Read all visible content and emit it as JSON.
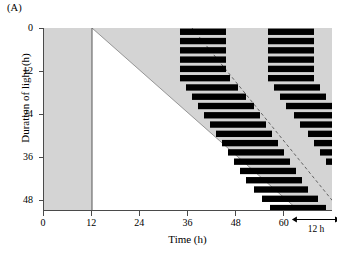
{
  "figure": {
    "panel_label": "(A)",
    "background_color": "#ffffff",
    "dark_shade_color": "#d4d4d4",
    "light_color": "#ffffff",
    "bar_color": "#000000",
    "axis_color": "#4a4a4a",
    "onset_line_color": "#8c8c8c"
  },
  "axes": {
    "x": {
      "label": "Time (h)",
      "ticks": [
        0,
        12,
        24,
        36,
        48,
        60
      ],
      "tick_labels": [
        "0",
        "12",
        "24",
        "36",
        "48",
        "60"
      ],
      "min": 0,
      "max": 72
    },
    "y": {
      "label": "Duration of light (h)",
      "ticks": [
        0,
        12,
        24,
        36,
        48
      ],
      "tick_labels": [
        "0",
        "12",
        "24",
        "36",
        "48"
      ],
      "min": 0,
      "max": 51
    }
  },
  "annotation": {
    "label": "12 h",
    "span_start_h": 62,
    "span_end_h": 74,
    "arrow_y_h": 51.5
  },
  "chart_data": {
    "type": "actogram",
    "title": "",
    "xlabel": "Time (h)",
    "ylabel": "Duration of light (h)",
    "xlim": [
      0,
      72
    ],
    "ylim": [
      0,
      51
    ],
    "grid": false,
    "legend": "none",
    "regions": {
      "dark_shaded": "grey region outside the light triangle",
      "light_triangle": {
        "vertices_h": [
          [
            12,
            0
          ],
          [
            12,
            51
          ],
          [
            63.5,
            51
          ]
        ],
        "note": "Light onset fixed at 12 h; light offset increases linearly with duration of light"
      },
      "light_offset_line": {
        "from": [
          12,
          0
        ],
        "to": [
          63.5,
          51
        ]
      }
    },
    "dashed_onset_line": {
      "label": "predicted activity onset",
      "from_h": [
        37.0,
        0
      ],
      "to_h": [
        74.0,
        51
      ],
      "style": "dashed"
    },
    "bars": [
      {
        "row": 0,
        "y_h": 0.0,
        "segments": [
          [
            34.0,
            45.5
          ],
          [
            56.0,
            67.5
          ]
        ]
      },
      {
        "row": 1,
        "y_h": 2.6,
        "segments": [
          [
            34.0,
            45.5
          ],
          [
            56.0,
            67.5
          ]
        ]
      },
      {
        "row": 2,
        "y_h": 5.2,
        "segments": [
          [
            34.0,
            45.5
          ],
          [
            56.0,
            67.5
          ]
        ]
      },
      {
        "row": 3,
        "y_h": 7.8,
        "segments": [
          [
            34.0,
            45.5
          ],
          [
            56.0,
            67.5
          ]
        ]
      },
      {
        "row": 4,
        "y_h": 10.4,
        "segments": [
          [
            34.0,
            45.5
          ],
          [
            56.0,
            67.5
          ]
        ]
      },
      {
        "row": 5,
        "y_h": 13.0,
        "segments": [
          [
            34.0,
            46.5
          ],
          [
            56.0,
            67.5
          ]
        ]
      },
      {
        "row": 6,
        "y_h": 15.6,
        "segments": [
          [
            35.5,
            48.5
          ],
          [
            57.5,
            69.0
          ]
        ]
      },
      {
        "row": 7,
        "y_h": 18.2,
        "segments": [
          [
            37.0,
            50.5
          ],
          [
            59.0,
            70.5
          ]
        ]
      },
      {
        "row": 8,
        "y_h": 20.8,
        "segments": [
          [
            38.5,
            52.5
          ],
          [
            60.5,
            72.0
          ]
        ]
      },
      {
        "row": 9,
        "y_h": 23.4,
        "segments": [
          [
            40.0,
            54.0
          ],
          [
            62.5,
            73.0
          ]
        ]
      },
      {
        "row": 10,
        "y_h": 26.0,
        "segments": [
          [
            41.5,
            55.5
          ],
          [
            64.0,
            74.0
          ]
        ]
      },
      {
        "row": 11,
        "y_h": 28.6,
        "segments": [
          [
            43.0,
            57.0
          ],
          [
            66.0,
            74.0
          ]
        ]
      },
      {
        "row": 12,
        "y_h": 31.2,
        "segments": [
          [
            44.5,
            58.5
          ],
          [
            67.5,
            74.0
          ]
        ]
      },
      {
        "row": 13,
        "y_h": 33.8,
        "segments": [
          [
            46.0,
            60.0
          ],
          [
            69.0,
            74.0
          ]
        ]
      },
      {
        "row": 14,
        "y_h": 36.4,
        "segments": [
          [
            47.5,
            61.5
          ],
          [
            70.5,
            74.0
          ]
        ]
      },
      {
        "row": 15,
        "y_h": 39.0,
        "segments": [
          [
            49.0,
            63.0
          ],
          [
            72.0,
            74.0
          ]
        ]
      },
      {
        "row": 16,
        "y_h": 41.6,
        "segments": [
          [
            50.5,
            64.5
          ]
        ]
      },
      {
        "row": 17,
        "y_h": 44.2,
        "segments": [
          [
            52.5,
            66.0
          ]
        ]
      },
      {
        "row": 18,
        "y_h": 46.8,
        "segments": [
          [
            54.5,
            68.5
          ],
          [
            72.0,
            74.0
          ]
        ]
      },
      {
        "row": 19,
        "y_h": 49.4,
        "segments": [
          [
            56.5,
            70.5
          ],
          [
            72.5,
            74.0
          ]
        ]
      }
    ]
  }
}
